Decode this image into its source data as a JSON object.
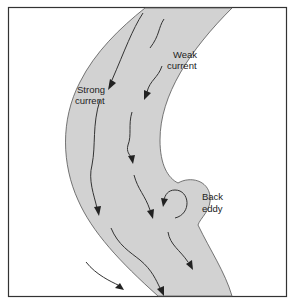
{
  "diagram": {
    "labels": {
      "weak": [
        "Weak",
        "current"
      ],
      "strong": [
        "Strong",
        "current"
      ],
      "eddy": [
        "Back",
        "eddy"
      ]
    },
    "colors": {
      "river": "#d2d2d2",
      "background": "#ffffff",
      "frame": "#333333",
      "arrows": "#333333"
    }
  }
}
